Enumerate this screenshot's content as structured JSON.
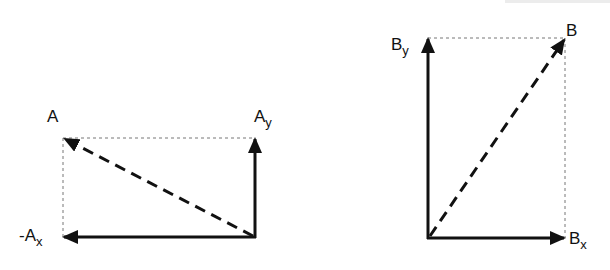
{
  "diagram": {
    "colors": {
      "vector": "#111111",
      "dotted": "#777777",
      "background": "#ffffff"
    },
    "vector_A": {
      "label": "A",
      "origin": [
        255,
        237
      ],
      "tip": [
        63,
        138
      ],
      "components": {
        "y": {
          "label_main": "A",
          "label_sub": "y",
          "from": [
            255,
            237
          ],
          "to": [
            255,
            138
          ]
        },
        "x": {
          "label_prefix": "-",
          "label_main": "A",
          "label_sub": "x",
          "from": [
            255,
            237
          ],
          "to": [
            63,
            237
          ]
        }
      }
    },
    "vector_B": {
      "label": "B",
      "origin": [
        428,
        238
      ],
      "tip": [
        565,
        38
      ],
      "components": {
        "y": {
          "label_main": "B",
          "label_sub": "y",
          "from": [
            428,
            238
          ],
          "to": [
            428,
            38
          ]
        },
        "x": {
          "label_main": "B",
          "label_sub": "x",
          "from": [
            428,
            238
          ],
          "to": [
            565,
            238
          ]
        }
      }
    }
  }
}
